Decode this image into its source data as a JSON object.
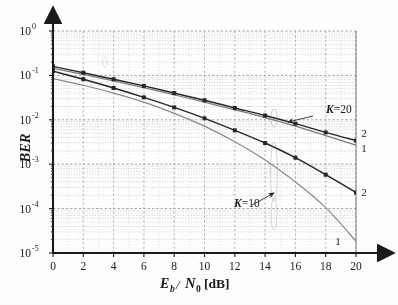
{
  "figure": {
    "kind": "scanned-line-plot",
    "background": "#ffffff",
    "ink_color": "#1a1a1a"
  },
  "chart_data": {
    "type": "line",
    "title": "",
    "subtitle": "",
    "xlabel": "Eb/N0 [dB]",
    "xlabel_parts": {
      "e": "E",
      "b": "b",
      "slash": "/",
      "n": "N",
      "zero": "0",
      "unit": "[dB]"
    },
    "ylabel": "BER",
    "xlim": [
      0,
      20
    ],
    "ylim": [
      1e-05,
      1
    ],
    "yscale": "log",
    "xscale": "linear",
    "xticks": [
      0,
      2,
      4,
      6,
      8,
      10,
      12,
      14,
      16,
      18,
      20
    ],
    "xtick_labels": [
      "0",
      "2",
      "4",
      "6",
      "8",
      "10",
      "12",
      "14",
      "16",
      "18",
      "20"
    ],
    "yticks": [
      1,
      0.1,
      0.01,
      0.001,
      0.0001,
      1e-05
    ],
    "ytick_labels": [
      "10^0",
      "10^-1",
      "10^-2",
      "10^-3",
      "10^-4",
      "10^-5"
    ],
    "ytick_mantissa": "10",
    "ytick_exponents": [
      "0",
      "-1",
      "-2",
      "-3",
      "-4",
      "-5"
    ],
    "grid": true,
    "grid_style": "dotted",
    "minor_grid": true,
    "legend": "none",
    "axis_arrows": true,
    "x": [
      0,
      2,
      4,
      6,
      8,
      10,
      12,
      14,
      16,
      18,
      20
    ],
    "series": [
      {
        "name": "K=20, curve 2",
        "group": "K=20",
        "end_label": "2",
        "color": "#262626",
        "marker": "square",
        "values": [
          0.16,
          0.115,
          0.082,
          0.058,
          0.04,
          0.0275,
          0.0185,
          0.0125,
          0.0082,
          0.0052,
          0.0034
        ]
      },
      {
        "name": "K=20, curve 1",
        "group": "K=20",
        "end_label": "1",
        "color": "#7a7a7a",
        "marker": "none",
        "values": [
          0.145,
          0.105,
          0.075,
          0.053,
          0.0365,
          0.025,
          0.0168,
          0.0112,
          0.0072,
          0.0044,
          0.0027
        ]
      },
      {
        "name": "K=10, curve 2",
        "group": "K=10",
        "end_label": "2",
        "color": "#262626",
        "marker": "square",
        "values": [
          0.125,
          0.082,
          0.052,
          0.032,
          0.019,
          0.0108,
          0.0058,
          0.003,
          0.0014,
          0.00058,
          0.00023
        ]
      },
      {
        "name": "K=10, curve 1",
        "group": "K=10",
        "end_label": "1",
        "color": "#8a8a8a",
        "marker": "none",
        "values": [
          0.085,
          0.06,
          0.04,
          0.025,
          0.014,
          0.0072,
          0.0032,
          0.00125,
          0.0004,
          0.000105,
          1.85e-05
        ]
      }
    ],
    "annotations": [
      {
        "text": "K=20",
        "x_px": 326,
        "y_px": 113,
        "arrow_from_x_px": 313,
        "arrow_from_y_px": 116,
        "arrow_to_x_px": 288,
        "arrow_to_y_px": 122
      },
      {
        "text": "K=10",
        "x_px": 234,
        "y_px": 207,
        "arrow_from_x_px": 252,
        "arrow_from_y_px": 205,
        "arrow_to_x_px": 274,
        "arrow_to_y_px": 193
      }
    ],
    "end_labels": [
      {
        "text": "2",
        "x_px": 364,
        "y_px": 137,
        "series": "K=20, curve 2"
      },
      {
        "text": "1",
        "x_px": 364,
        "y_px": 152,
        "series": "K=20, curve 1"
      },
      {
        "text": "2",
        "x_px": 364,
        "y_px": 196,
        "series": "K=10, curve 2"
      },
      {
        "text": "1",
        "x_px": 338,
        "y_px": 245,
        "series": "K=10, curve 1"
      }
    ]
  }
}
